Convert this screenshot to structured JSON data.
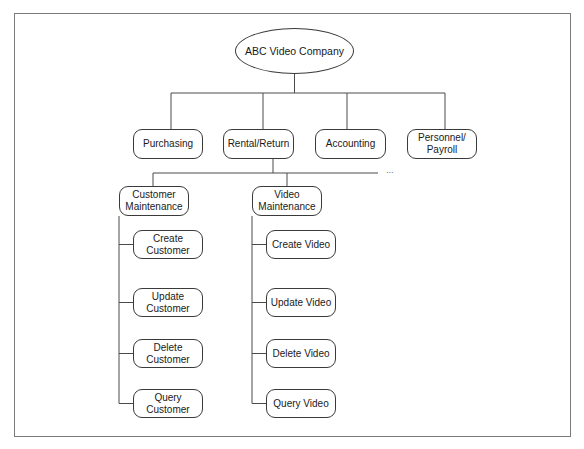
{
  "diagram": {
    "title": "ABC Video Company",
    "type": "hierarchy-chart",
    "root": {
      "label": "ABC Video Company",
      "box": [
        235,
        28,
        119,
        46
      ]
    },
    "level1": [
      {
        "id": "purchasing",
        "label": "Purchasing",
        "box": [
          133,
          129,
          70,
          30
        ],
        "x": 171
      },
      {
        "id": "rental-return",
        "label": "Rental/Return",
        "box": [
          223,
          129,
          71,
          30
        ],
        "x": 263
      },
      {
        "id": "accounting",
        "label": "Accounting",
        "box": [
          315,
          129,
          71,
          30
        ],
        "x": 347
      },
      {
        "id": "personnel-payroll",
        "label": "Personnel/\nPayroll",
        "box": [
          407,
          129,
          70,
          30
        ],
        "x": 445
      }
    ],
    "level2": [
      {
        "id": "customer-maintenance",
        "label": "Customer\nMaintenance",
        "box": [
          119,
          186,
          70,
          30
        ],
        "x": 153
      },
      {
        "id": "video-maintenance",
        "label": "Video\nMaintenance",
        "box": [
          252,
          186,
          70,
          30
        ],
        "x": 287
      }
    ],
    "customer_children": [
      {
        "id": "create-customer",
        "label": "Create\nCustomer",
        "box": [
          133,
          230,
          70,
          29
        ]
      },
      {
        "id": "update-customer",
        "label": "Update\nCustomer",
        "box": [
          133,
          288,
          70,
          29
        ]
      },
      {
        "id": "delete-customer",
        "label": "Delete\nCustomer",
        "box": [
          133,
          339,
          70,
          29
        ]
      },
      {
        "id": "query-customer",
        "label": "Query Customer",
        "box": [
          133,
          389,
          70,
          29
        ]
      }
    ],
    "video_children": [
      {
        "id": "create-video",
        "label": "Create Video",
        "box": [
          266,
          230,
          70,
          29
        ]
      },
      {
        "id": "update-video",
        "label": "Update Video",
        "box": [
          266,
          288,
          70,
          29
        ]
      },
      {
        "id": "delete-video",
        "label": "Delete Video",
        "box": [
          266,
          339,
          70,
          29
        ]
      },
      {
        "id": "query-video",
        "label": "Query Video",
        "box": [
          266,
          389,
          70,
          29
        ]
      }
    ],
    "continuation_marker": "...",
    "connectors": {
      "root_bus_y": 93,
      "rental_bus_y": 173,
      "rental_bus_x_end": 378,
      "rental_drop_x": 273
    }
  }
}
